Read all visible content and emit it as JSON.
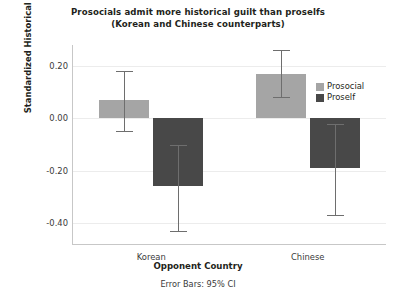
{
  "chart_data": {
    "type": "bar",
    "title": "Prosocials admit more historical guilt than proselfs",
    "subtitle": "(Korean and Chinese counterparts)",
    "xlabel": "Opponent Country",
    "ylabel": "Standardized Historical Guilt",
    "footnote": "Error Bars: 95% CI",
    "categories": [
      "Korean",
      "Chinese"
    ],
    "ylim": [
      -0.48,
      0.28
    ],
    "yticks": [
      0.2,
      0.0,
      -0.2,
      -0.4
    ],
    "ytick_labels": [
      "0.20",
      "0.00",
      "-0.20",
      "-0.40"
    ],
    "grid": true,
    "legend_position": "inside-top-right",
    "error_bar_type": "95% CI",
    "series": [
      {
        "name": "Prosocial",
        "color": "#a5a5a5",
        "values": [
          0.07,
          0.17
        ],
        "ci_low": [
          -0.05,
          0.08
        ],
        "ci_high": [
          0.18,
          0.26
        ]
      },
      {
        "name": "Proself",
        "color": "#484848",
        "values": [
          -0.26,
          -0.19
        ],
        "ci_low": [
          -0.43,
          -0.37
        ],
        "ci_high": [
          -0.1,
          -0.02
        ]
      }
    ]
  },
  "colors": {
    "prosocial": "#a5a5a5",
    "proself": "#484848",
    "gridline": "#ececec",
    "axis": "#c7c7c7",
    "error_bar": "#6e6e6e",
    "text": "#231f20",
    "background": "#ffffff"
  }
}
